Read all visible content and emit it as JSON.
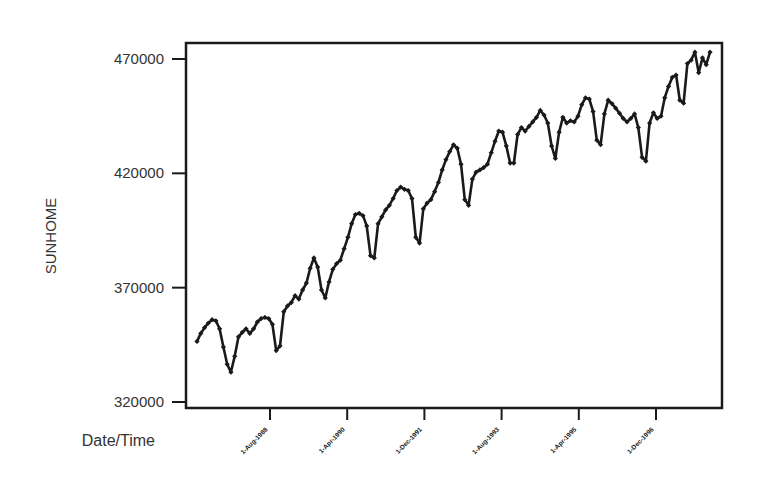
{
  "chart_data": {
    "type": "line",
    "title": "",
    "xlabel": "Date/Time",
    "ylabel": "SUNHOME",
    "ylim": [
      318000,
      477000
    ],
    "yticks": [
      320000,
      370000,
      420000,
      470000
    ],
    "ytick_labels": [
      "320000",
      "370000",
      "420000",
      "470000"
    ],
    "xtick_labels": [
      "1-Aug-1988",
      "1-Apr-1990",
      "1-Dec-1991",
      "1-Aug-1993",
      "1-Apr-1995",
      "1-Dec-1996"
    ],
    "xtick_index": [
      19,
      39,
      59,
      79,
      99,
      119
    ],
    "grid": false,
    "legend": "none",
    "marker": "diamond",
    "line_color": "#1a1a1a",
    "series": [
      {
        "name": "SUNHOME",
        "values": [
          346500,
          350000,
          352500,
          354500,
          356000,
          355500,
          352000,
          344000,
          336500,
          333000,
          340000,
          348500,
          350500,
          352000,
          350000,
          352000,
          355000,
          356500,
          357000,
          356500,
          354000,
          342500,
          344500,
          359500,
          362000,
          363500,
          366500,
          365000,
          369000,
          372000,
          378500,
          383000,
          379000,
          369000,
          365500,
          372500,
          378000,
          380500,
          382000,
          387000,
          392000,
          398000,
          402000,
          402500,
          401500,
          397000,
          384000,
          383000,
          398000,
          401000,
          404000,
          406000,
          409000,
          412500,
          414000,
          413000,
          412500,
          409000,
          392000,
          389500,
          404500,
          407000,
          408500,
          412000,
          416000,
          421500,
          426000,
          429500,
          432500,
          431000,
          424000,
          408500,
          406000,
          417500,
          420500,
          421500,
          422500,
          424000,
          429000,
          434000,
          438500,
          438000,
          432000,
          424500,
          424500,
          437000,
          440000,
          438500,
          440500,
          442500,
          444500,
          447500,
          445500,
          442000,
          432000,
          426500,
          438000,
          444500,
          442000,
          443000,
          442500,
          445000,
          450000,
          453000,
          452500,
          447000,
          434500,
          432500,
          446000,
          452000,
          450500,
          448500,
          446300,
          444000,
          442500,
          444000,
          446000,
          440000,
          427000,
          425300,
          442000,
          446500,
          444000,
          445000,
          453000,
          458000,
          462000,
          463000,
          452000,
          450700,
          468000,
          469500,
          473000,
          464000,
          470500,
          467500,
          473000
        ]
      }
    ]
  },
  "axes": {
    "x_title": "Date/Time",
    "y_title": "SUNHOME"
  }
}
